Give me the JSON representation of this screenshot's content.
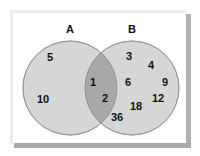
{
  "diagram": {
    "type": "venn",
    "colors": {
      "background": "#ffffff",
      "frame_light": "#eeeeee",
      "frame_shadow": "#a9a9a9",
      "circle_fill": "#d6d6d6",
      "intersection_fill": "#a8a8a8",
      "circle_stroke": "#9a9a9a",
      "text": "#111111"
    },
    "sets": [
      {
        "id": "A",
        "label": "A",
        "cx": 70,
        "cy": 88,
        "r": 47,
        "label_x": 70,
        "label_y": 33
      },
      {
        "id": "B",
        "label": "B",
        "cx": 132,
        "cy": 88,
        "r": 47,
        "label_x": 132,
        "label_y": 33
      }
    ],
    "regions": {
      "A_only": [
        {
          "value": "5",
          "x": 50,
          "y": 61
        },
        {
          "value": "10",
          "x": 43,
          "y": 103
        }
      ],
      "A_and_B": [
        {
          "value": "1",
          "x": 93,
          "y": 86
        },
        {
          "value": "2",
          "x": 105,
          "y": 102
        }
      ],
      "B_only": [
        {
          "value": "3",
          "x": 129,
          "y": 60
        },
        {
          "value": "4",
          "x": 151,
          "y": 69
        },
        {
          "value": "6",
          "x": 128,
          "y": 86
        },
        {
          "value": "9",
          "x": 165,
          "y": 86
        },
        {
          "value": "12",
          "x": 158,
          "y": 102
        },
        {
          "value": "18",
          "x": 136,
          "y": 110
        },
        {
          "value": "36",
          "x": 117,
          "y": 121
        }
      ]
    }
  }
}
